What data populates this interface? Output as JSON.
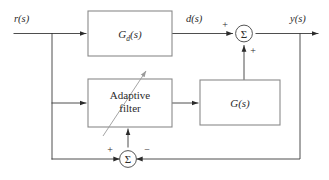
{
  "diagram": {
    "type": "block-diagram",
    "colors": {
      "background": "#ffffff",
      "block_stroke": "#8a8a8a",
      "wire": "#3a3a3a",
      "sum_stroke": "#555555",
      "text": "#2b2b2b",
      "adaptive_arrow": "#9a9a9a"
    },
    "signals": {
      "input": "r(s)",
      "disturbance": "d(s)",
      "output": "y(s)"
    },
    "blocks": {
      "gd": {
        "name": "G",
        "subscript": "d",
        "suffix": "(s)",
        "full": "G_d(s)"
      },
      "adaptive_filter": {
        "line1": "Adaptive",
        "line2": "filter"
      },
      "plant": {
        "full": "G(s)"
      }
    },
    "summers": {
      "top": {
        "glyph": "Σ",
        "sign_left": "+",
        "sign_bottom": "+"
      },
      "bottom": {
        "glyph": "Σ",
        "sign_left": "+",
        "sign_right": "−"
      }
    },
    "icons": {
      "adaptive_tuning": "diagonal-arrow-icon",
      "arrowhead": "arrowhead-icon"
    }
  }
}
